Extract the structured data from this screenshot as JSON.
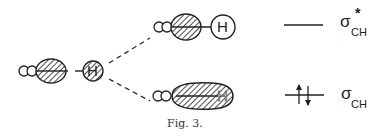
{
  "figure": {
    "caption": "Fig. 3.",
    "left_fragment": {
      "atom_label": "H"
    },
    "antibonding_orbital": {
      "atom_label": "H"
    },
    "bonding_orbital": {
      "atom_label": "H"
    },
    "levels": {
      "antibonding": {
        "symbol": "σ",
        "subscript": "CH",
        "superscript": "*"
      },
      "bonding": {
        "symbol": "σ",
        "subscript": "CH",
        "electrons": "↑↓"
      }
    }
  }
}
